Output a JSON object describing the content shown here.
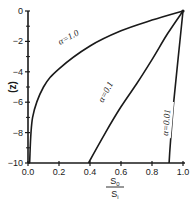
{
  "chart_data": {
    "type": "line",
    "title": "",
    "xlabel": "S0 / Si",
    "xlabel_numerator": "S",
    "xlabel_numerator_sub": "0",
    "xlabel_denominator": "S",
    "xlabel_denominator_sub": "i",
    "ylabel": "(z)",
    "xlim": [
      0.0,
      1.0
    ],
    "ylim": [
      -10,
      0
    ],
    "xticks": [
      "0.0",
      "0.2",
      "0.4",
      "0.6",
      "0.8",
      "1.0"
    ],
    "yticks": [
      "0",
      "-2",
      "-4",
      "-6",
      "-8",
      "-10"
    ],
    "grid": false,
    "legend": "inline labels on curves",
    "series": [
      {
        "name": "α = 1.0",
        "label": "α=1.0",
        "x": [
          1.0,
          0.8,
          0.6,
          0.4,
          0.2,
          0.1,
          0.03,
          0.01
        ],
        "y": [
          0,
          -0.6,
          -1.3,
          -2.3,
          -3.8,
          -5.0,
          -7.0,
          -10.0
        ]
      },
      {
        "name": "α = 0.1",
        "label": "α=0.1",
        "x": [
          1.0,
          0.9,
          0.8,
          0.7,
          0.6,
          0.5,
          0.39
        ],
        "y": [
          0,
          -1.5,
          -3.2,
          -4.8,
          -6.3,
          -8.0,
          -10.0
        ]
      },
      {
        "name": "α = 0.01",
        "label": "α=0.01",
        "x": [
          1.0,
          0.97,
          0.94,
          0.92,
          0.91
        ],
        "y": [
          0,
          -3.0,
          -6.0,
          -8.5,
          -10.0
        ]
      }
    ]
  },
  "colors": {
    "ink": "#1a1a1a",
    "background": "#ffffff"
  }
}
